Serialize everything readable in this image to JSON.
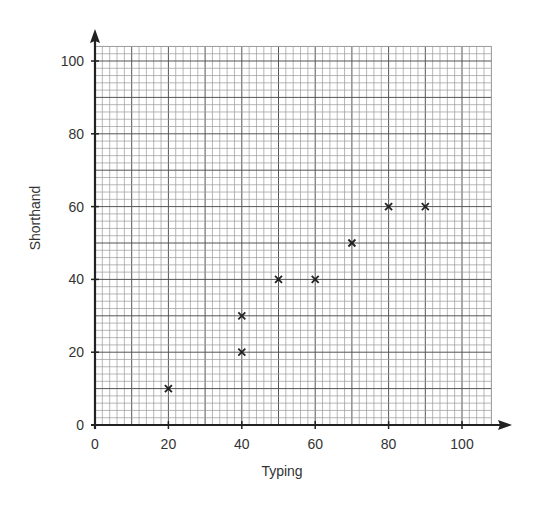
{
  "chart_data": {
    "type": "scatter",
    "title": "",
    "xlabel": "Typing",
    "ylabel": "Shorthand",
    "xlim": [
      0,
      100
    ],
    "ylim": [
      0,
      100
    ],
    "xticks": [
      0,
      20,
      40,
      60,
      80,
      100
    ],
    "yticks": [
      0,
      20,
      40,
      60,
      80,
      100
    ],
    "grid": true,
    "grid_minor_step": 2,
    "grid_major_step": 10,
    "marker": "x",
    "points": [
      {
        "x": 20,
        "y": 10
      },
      {
        "x": 40,
        "y": 20
      },
      {
        "x": 40,
        "y": 30
      },
      {
        "x": 50,
        "y": 40
      },
      {
        "x": 60,
        "y": 40
      },
      {
        "x": 70,
        "y": 50
      },
      {
        "x": 80,
        "y": 60
      },
      {
        "x": 90,
        "y": 60
      }
    ],
    "colors": {
      "axis": "#222222",
      "grid_minor": "#9a9a9a",
      "grid_major": "#555555",
      "marker": "#222222",
      "text": "#333333"
    }
  }
}
